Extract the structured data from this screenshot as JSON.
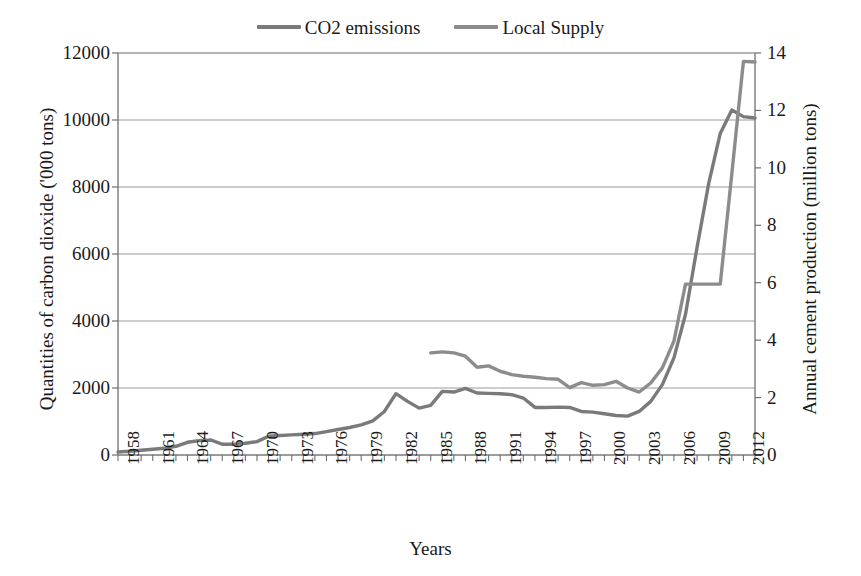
{
  "chart_data": {
    "type": "line",
    "title": "",
    "xlabel": "Years",
    "ylabel": "Quantities of carbon dioxide ('000 tons)",
    "ylabel_right": "Annual cement production (million tons)",
    "ylim": [
      0,
      12000
    ],
    "ylim_right": [
      0,
      14
    ],
    "yticks": [
      "0",
      "2000",
      "4000",
      "6000",
      "8000",
      "10000",
      "12000"
    ],
    "yticks_right": [
      "0",
      "2",
      "4",
      "6",
      "8",
      "10",
      "12",
      "14"
    ],
    "grid": true,
    "legend_position": "top-center",
    "xlim": [
      1958,
      2013
    ],
    "xtick_labels": [
      "1958",
      "1961",
      "1964",
      "1967",
      "1970",
      "1973",
      "1976",
      "1979",
      "1982",
      "1985",
      "1988",
      "1991",
      "1994",
      "1997",
      "2000",
      "2003",
      "2006",
      "2009",
      "2012"
    ],
    "x_all_years": [
      1958,
      1959,
      1960,
      1961,
      1962,
      1963,
      1964,
      1965,
      1966,
      1967,
      1968,
      1969,
      1970,
      1971,
      1972,
      1973,
      1974,
      1975,
      1976,
      1977,
      1978,
      1979,
      1980,
      1981,
      1982,
      1983,
      1984,
      1985,
      1986,
      1987,
      1988,
      1989,
      1990,
      1991,
      1992,
      1993,
      1994,
      1995,
      1996,
      1997,
      1998,
      1999,
      2000,
      2001,
      2002,
      2003,
      2004,
      2005,
      2006,
      2007,
      2008,
      2009,
      2010,
      2011,
      2012,
      2013
    ],
    "series": [
      {
        "name": "CO2 emissions",
        "color": "#7a7a7a",
        "axis": "left",
        "units": "'000 tons",
        "x": [
          1958,
          1959,
          1960,
          1961,
          1962,
          1963,
          1964,
          1965,
          1966,
          1967,
          1968,
          1969,
          1970,
          1971,
          1972,
          1973,
          1974,
          1975,
          1976,
          1977,
          1978,
          1979,
          1980,
          1981,
          1982,
          1983,
          1984,
          1985,
          1986,
          1987,
          1988,
          1989,
          1990,
          1991,
          1992,
          1993,
          1994,
          1995,
          1996,
          1997,
          1998,
          1999,
          2000,
          2001,
          2002,
          2003,
          2004,
          2005,
          2006,
          2007,
          2008,
          2009,
          2010,
          2011,
          2012,
          2013
        ],
        "values": [
          90,
          110,
          140,
          170,
          200,
          260,
          380,
          430,
          450,
          320,
          320,
          350,
          400,
          560,
          580,
          600,
          620,
          640,
          700,
          760,
          820,
          900,
          1020,
          1300,
          1830,
          1600,
          1400,
          1480,
          1900,
          1880,
          1990,
          1850,
          1840,
          1830,
          1800,
          1700,
          1420,
          1420,
          1430,
          1420,
          1300,
          1280,
          1230,
          1180,
          1160,
          1300,
          1600,
          2100,
          2900,
          4200,
          6200,
          8100,
          9600,
          10300,
          10100,
          10060
        ]
      },
      {
        "name": "Local Supply",
        "color": "#8c8c8c",
        "axis": "right",
        "units": "million tons",
        "x": [
          1985,
          1986,
          1987,
          1988,
          1989,
          1990,
          1991,
          1992,
          1993,
          1994,
          1995,
          1996,
          1997,
          1998,
          1999,
          2000,
          2001,
          2002,
          2003,
          2004,
          2005,
          2006,
          2007,
          2008,
          2009,
          2010,
          2011,
          2012,
          2013
        ],
        "values_left_scale": [
          3050,
          3080,
          3050,
          2950,
          2620,
          2660,
          2500,
          2400,
          2350,
          2320,
          2280,
          2260,
          2010,
          2160,
          2080,
          2100,
          2200,
          2000,
          1880,
          2150,
          2600,
          3400,
          5100,
          5100,
          5100,
          5100,
          8400,
          11750,
          11730
        ],
        "values": [
          3.56,
          3.59,
          3.56,
          3.44,
          3.06,
          3.1,
          2.92,
          2.8,
          2.74,
          2.71,
          2.66,
          2.64,
          2.35,
          2.52,
          2.43,
          2.45,
          2.57,
          2.33,
          2.19,
          2.51,
          3.03,
          3.97,
          5.95,
          5.95,
          5.95,
          5.95,
          9.8,
          13.71,
          13.69
        ]
      }
    ]
  },
  "legend": {
    "entries": [
      {
        "label": "CO2 emissions",
        "color": "#7a7a7a"
      },
      {
        "label": "Local Supply",
        "color": "#8c8c8c"
      }
    ]
  },
  "axes": {
    "left_title": "Quantities of carbon dioxide ('000 tons)",
    "right_title": "Annual cement production (million tons)",
    "x_title": "Years"
  }
}
